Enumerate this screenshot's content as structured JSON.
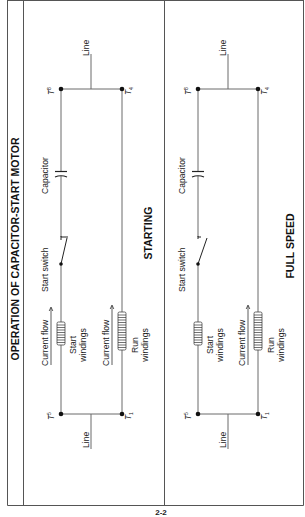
{
  "figure": {
    "title": "OPERATION OF CAPACITOR-START MOTOR",
    "page_number": "2-2",
    "orientation": "rotated 90° counter-clockwise"
  },
  "panels": [
    {
      "state_label": "STARTING",
      "switch_state": "closed",
      "labels": {
        "line_top": "Line",
        "line_bottom": "Line",
        "capacitor": "Capacitor",
        "start_switch": "Start switch",
        "current_flow_start": "Current flow",
        "start_windings_1": "Start",
        "start_windings_2": "windings",
        "current_flow_run": "Current flow",
        "run_windings_1": "Run",
        "run_windings_2": "windings"
      },
      "terminals": {
        "t8": {
          "letter": "T",
          "sub": "8"
        },
        "t4": {
          "letter": "T",
          "sub": "4"
        },
        "t5": {
          "letter": "T",
          "sub": "5"
        },
        "t1": {
          "letter": "T",
          "sub": "1"
        }
      }
    },
    {
      "state_label": "FULL SPEED",
      "switch_state": "open",
      "labels": {
        "line_top": "Line",
        "line_bottom": "Line",
        "capacitor": "Capacitor",
        "start_switch": "Start switch",
        "start_windings_1": "Start",
        "start_windings_2": "windings",
        "current_flow_run": "Current flow",
        "run_windings_1": "Run",
        "run_windings_2": "windings"
      },
      "terminals": {
        "t8": {
          "letter": "T",
          "sub": "8"
        },
        "t4": {
          "letter": "T",
          "sub": "4"
        },
        "t5": {
          "letter": "T",
          "sub": "5"
        },
        "t1": {
          "letter": "T",
          "sub": "1"
        }
      }
    }
  ],
  "colors": {
    "background": "#ffffff",
    "line": "#6a6a6a",
    "text": "#222222"
  }
}
